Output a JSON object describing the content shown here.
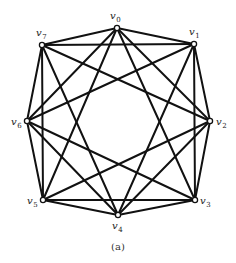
{
  "figure": {
    "caption": "(a)"
  },
  "colors": {
    "edge": "#111111",
    "node_fill": "#ffffff",
    "node_stroke": "#111111",
    "text": "#222222",
    "background": "#ffffff"
  },
  "graph": {
    "vertices": [
      {
        "id": "v0",
        "letter": "v",
        "sub": "0",
        "x": 117,
        "y": 28,
        "lx": 110,
        "ly": 19
      },
      {
        "id": "v1",
        "letter": "v",
        "sub": "1",
        "x": 194,
        "y": 44,
        "lx": 189,
        "ly": 35
      },
      {
        "id": "v2",
        "letter": "v",
        "sub": "2",
        "x": 210,
        "y": 121,
        "lx": 216,
        "ly": 125
      },
      {
        "id": "v3",
        "letter": "v",
        "sub": "3",
        "x": 195,
        "y": 200,
        "lx": 200,
        "ly": 204
      },
      {
        "id": "v4",
        "letter": "v",
        "sub": "4",
        "x": 118,
        "y": 215,
        "lx": 112,
        "ly": 229
      },
      {
        "id": "v5",
        "letter": "v",
        "sub": "5",
        "x": 43,
        "y": 200,
        "lx": 27,
        "ly": 204
      },
      {
        "id": "v6",
        "letter": "v",
        "sub": "6",
        "x": 27,
        "y": 121,
        "lx": 11,
        "ly": 125
      },
      {
        "id": "v7",
        "letter": "v",
        "sub": "7",
        "x": 42,
        "y": 45,
        "lx": 36,
        "ly": 36
      }
    ],
    "edges": [
      [
        "v0",
        "v1"
      ],
      [
        "v1",
        "v2"
      ],
      [
        "v2",
        "v3"
      ],
      [
        "v3",
        "v4"
      ],
      [
        "v4",
        "v5"
      ],
      [
        "v5",
        "v6"
      ],
      [
        "v6",
        "v7"
      ],
      [
        "v7",
        "v0"
      ],
      [
        "v0",
        "v2"
      ],
      [
        "v1",
        "v3"
      ],
      [
        "v2",
        "v4"
      ],
      [
        "v3",
        "v5"
      ],
      [
        "v4",
        "v6"
      ],
      [
        "v5",
        "v7"
      ],
      [
        "v6",
        "v0"
      ],
      [
        "v7",
        "v1"
      ],
      [
        "v0",
        "v3"
      ],
      [
        "v1",
        "v4"
      ],
      [
        "v2",
        "v5"
      ],
      [
        "v3",
        "v6"
      ],
      [
        "v4",
        "v7"
      ],
      [
        "v5",
        "v0"
      ],
      [
        "v6",
        "v1"
      ],
      [
        "v7",
        "v2"
      ]
    ]
  }
}
